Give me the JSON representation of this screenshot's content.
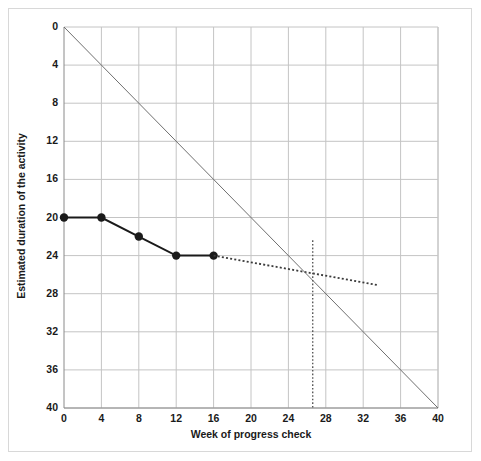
{
  "chart_data": {
    "type": "line",
    "title": "",
    "xlabel": "Week of progress check",
    "ylabel": "Estimated duration of the activity",
    "xlim": [
      0,
      40
    ],
    "ylim": [
      0,
      40
    ],
    "y_inverted": true,
    "grid": true,
    "legend_position": "none",
    "xticks": [
      0,
      4,
      8,
      12,
      16,
      20,
      24,
      28,
      32,
      36,
      40
    ],
    "yticks": [
      0,
      4,
      8,
      12,
      16,
      20,
      24,
      28,
      32,
      36,
      40
    ],
    "xtick_labels": [
      "0",
      "4",
      "8",
      "12",
      "16",
      "20",
      "24",
      "28",
      "32",
      "36",
      "40"
    ],
    "ytick_labels": [
      "0",
      "4",
      "8",
      "12",
      "16",
      "20",
      "24",
      "28",
      "32",
      "36",
      "40"
    ],
    "series": [
      {
        "name": "estimated-duration-observed",
        "style": "solid-with-markers",
        "color": "#1a1a1a",
        "x": [
          0,
          4,
          8,
          12,
          16
        ],
        "values": [
          20,
          20,
          22,
          24,
          24
        ]
      },
      {
        "name": "projected-trend",
        "style": "dotted",
        "color": "#3a3a3a",
        "x": [
          16,
          33.6
        ],
        "values": [
          24,
          27.1
        ]
      },
      {
        "name": "time-now-reference-line",
        "style": "solid-thin",
        "color": "#6f6f6f",
        "x": [
          0,
          40
        ],
        "values": [
          0,
          40
        ]
      },
      {
        "name": "completion-week-marker",
        "style": "dotted-vertical",
        "color": "#5a5a5a",
        "x": [
          26.6,
          26.6
        ],
        "values": [
          22.4,
          40
        ]
      }
    ],
    "annotations": [
      {
        "name": "intersection-week",
        "x": 26.6,
        "y": 26.6
      }
    ]
  },
  "colors": {
    "grid": "#c4c4c4",
    "axis": "#8a8a8a",
    "data": "#1a1a1a",
    "reference": "#6f6f6f",
    "border": "#d8d8d8",
    "background": "#ffffff"
  }
}
